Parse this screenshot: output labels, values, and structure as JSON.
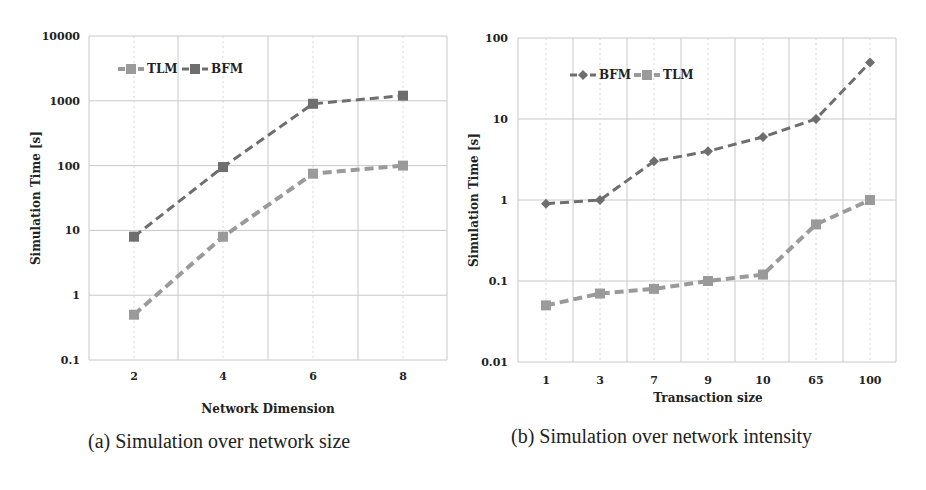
{
  "figure": {
    "panels": [
      {
        "caption": "(a) Simulation over network size",
        "xlabel": "Network Dimension",
        "ylabel": "Simulation Time [s]",
        "legend": [
          "TLM",
          "BFM"
        ]
      },
      {
        "caption": "(b) Simulation over network intensity",
        "xlabel": "Transaction size",
        "ylabel": "Simulation Time  [s]",
        "legend": [
          "BFM",
          "TLM"
        ]
      }
    ]
  },
  "colors": {
    "tlm": "#9a9a9a",
    "bfm": "#6e6e6e",
    "grid": "#c8c8c8",
    "axis_text": "#222222"
  },
  "chart_data": [
    {
      "type": "line",
      "title": "(a) Simulation over network size",
      "xlabel": "Network Dimension",
      "ylabel": "Simulation Time [s]",
      "yscale": "log",
      "ylim": [
        0.1,
        10000
      ],
      "yticks": [
        "0.1",
        "1",
        "10",
        "100",
        "1000",
        "10000"
      ],
      "categories": [
        "2",
        "4",
        "6",
        "8"
      ],
      "grid": true,
      "legend_position": "upper-left",
      "series": [
        {
          "name": "TLM",
          "marker": "square",
          "line": "dashed",
          "values": [
            0.5,
            8,
            75,
            100
          ]
        },
        {
          "name": "BFM",
          "marker": "square",
          "line": "dashed",
          "values": [
            8,
            95,
            900,
            1200
          ]
        }
      ]
    },
    {
      "type": "line",
      "title": "(b) Simulation over network intensity",
      "xlabel": "Transaction size",
      "ylabel": "Simulation Time  [s]",
      "yscale": "log",
      "ylim": [
        0.01,
        100
      ],
      "yticks": [
        "0.01",
        "0.1",
        "1",
        "10",
        "100"
      ],
      "categories": [
        "1",
        "3",
        "7",
        "9",
        "10",
        "65",
        "100"
      ],
      "grid": true,
      "legend_position": "upper-left",
      "series": [
        {
          "name": "BFM",
          "marker": "diamond",
          "line": "dashed",
          "values": [
            0.9,
            1.0,
            3.0,
            4.0,
            6.0,
            10.0,
            50.0
          ]
        },
        {
          "name": "TLM",
          "marker": "square",
          "line": "dashed",
          "values": [
            0.05,
            0.07,
            0.08,
            0.1,
            0.12,
            0.5,
            1.0
          ]
        }
      ]
    }
  ]
}
